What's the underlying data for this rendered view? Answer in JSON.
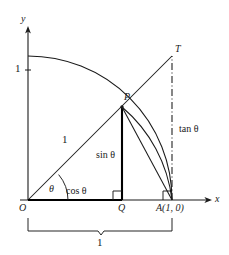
{
  "figure": {
    "colors": {
      "stroke": "#1a1a1a",
      "background": "#ffffff",
      "emphasis": "#000000"
    },
    "geometry": {
      "origin": {
        "x": 28,
        "y": 200
      },
      "point_a": {
        "x": 172,
        "y": 200
      },
      "point_p": {
        "x": 122,
        "y": 107
      },
      "point_q": {
        "x": 122,
        "y": 200
      },
      "point_t": {
        "x": 172,
        "y": 56
      },
      "radius_px": 144,
      "unit_y_px": {
        "x": 28,
        "y": 70
      },
      "theta_degrees": 40
    },
    "axes": {
      "x_label": "x",
      "y_label": "y",
      "y_tick_label": "1"
    },
    "points": {
      "origin_label": "O",
      "p_label": "P",
      "q_label": "Q",
      "t_label": "T",
      "a_label": "A(1, 0)"
    },
    "segments": {
      "radius_label": "1",
      "cos_label": "cos θ",
      "sin_label": "sin θ",
      "tan_label": "tan θ",
      "angle_label": "θ",
      "brace_label": "1"
    }
  }
}
